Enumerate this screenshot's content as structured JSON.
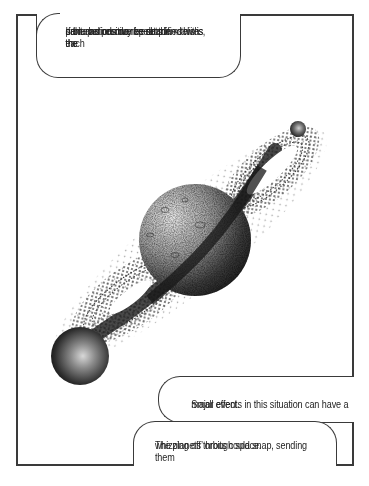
{
  "figure": {
    "colors": {
      "frame": "#3a3a3a",
      "background": "#ffffff",
      "ink": "#222222"
    }
  },
  "callouts": {
    "top": {
      "lines": [
        "If the periods do repeat themselves, the",
        "perturbation may be amplified with each",
        "orbit and resonance sets in – this is the",
        "same as positive feedback."
      ]
    },
    "middle": {
      "lines": [
        "Small events in this situation can have a",
        "major effect."
      ]
    },
    "bottom": {
      "lines": [
        "The planets’ orbits could snap, sending them",
        "whizzing off through space."
      ]
    }
  },
  "bodies": {
    "central_planet": "cratered-planet",
    "large_moon": "sphere-lower-left",
    "small_moon": "sphere-upper-right"
  }
}
